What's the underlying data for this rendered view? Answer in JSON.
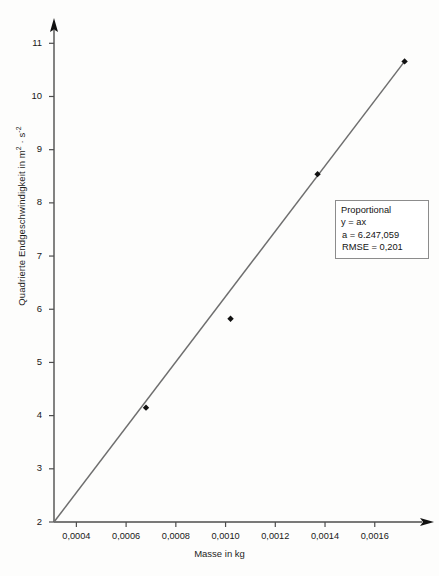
{
  "chart_data": {
    "type": "scatter",
    "title": "",
    "xlabel": "Masse in kg",
    "ylabel_text": "Quadrierte Endgeschwindigkeit in m",
    "ylabel_sup1": "2",
    "ylabel_mid": " · s",
    "ylabel_sup2": "-2",
    "ylabel_full": "Quadrierte Endgeschwindigkeit in m² · s⁻²",
    "xlim": [
      0.00031,
      0.00179
    ],
    "ylim": [
      2.0,
      11.25
    ],
    "grid": false,
    "legend_position": "right-middle",
    "x": [
      0.00068,
      0.00102,
      0.00137,
      0.00172
    ],
    "y": [
      4.15,
      5.82,
      8.54,
      10.66
    ],
    "xtick_labels": [
      "0,0004",
      "0,0006",
      "0,0008",
      "0,0010",
      "0,0012",
      "0,0014",
      "0,0016"
    ],
    "xtick_values": [
      0.0004,
      0.0006,
      0.0008,
      0.001,
      0.0012,
      0.0014,
      0.0016
    ],
    "ytick_labels": [
      "2",
      "3",
      "4",
      "5",
      "6",
      "7",
      "8",
      "9",
      "10",
      "11"
    ],
    "ytick_values": [
      2,
      3,
      4,
      5,
      6,
      7,
      8,
      9,
      10,
      11
    ],
    "series": [
      {
        "name": "Messpunkte",
        "type": "scatter",
        "marker": "diamond",
        "color": "#111111",
        "values": [
          {
            "x": 0.00068,
            "y": 4.15
          },
          {
            "x": 0.00102,
            "y": 5.82
          },
          {
            "x": 0.00137,
            "y": 8.54
          },
          {
            "x": 0.00172,
            "y": 10.66
          }
        ]
      },
      {
        "name": "Proportional",
        "type": "line",
        "color": "#6e6e6e",
        "equation": "y = ax",
        "slope": 6247.059,
        "x_start": 0.00031,
        "y_start": 2.0,
        "x_end": 0.00172,
        "y_end": 10.66
      }
    ],
    "annotations": {
      "fit_box": {
        "model": "Proportional",
        "equation": "y = ax",
        "coefficient": "a = 6.247,059",
        "rmse": "RMSE = 0,201"
      }
    }
  },
  "axes": {
    "y_axis_name": "y-axis",
    "x_axis_name": "x-axis"
  },
  "colors": {
    "fit_line": "#6e6e6e",
    "axis": "#4d4d4d",
    "marker": "#111111",
    "legend_border": "#8c8c8c",
    "background": "#fdfdfc"
  }
}
